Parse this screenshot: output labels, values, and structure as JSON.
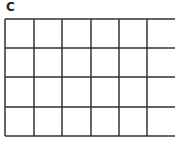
{
  "panel": {
    "label": "C"
  },
  "grid": {
    "rows": 4,
    "columns": 6,
    "line_color": "#333333",
    "x_lines": [
      5,
      34,
      62,
      91,
      119,
      147
    ],
    "y_lines": [
      19,
      48,
      77,
      107,
      136
    ],
    "right_edge_clipped": true
  }
}
